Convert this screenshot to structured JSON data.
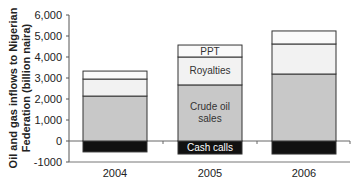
{
  "chart_data": {
    "type": "bar",
    "stacked": true,
    "title": "",
    "xlabel": "",
    "ylabel": "Oil and gas inflows to Nigerian Federation (billion naira)",
    "ylabel_lines": [
      "Oil and gas inflows to Nigerian",
      "Federation (billion naira)"
    ],
    "ylim": [
      -1000,
      6000
    ],
    "yticks": [
      -1000,
      0,
      1000,
      2000,
      3000,
      4000,
      5000,
      6000
    ],
    "ytick_labels": [
      "-1000",
      "0",
      "1,000",
      "2,000",
      "3,000",
      "4,000",
      "5,000",
      "6,000"
    ],
    "grid": false,
    "legend": "inline labels on 2005 bar",
    "categories": [
      "2004",
      "2005",
      "2006"
    ],
    "series": [
      {
        "name": "Cash calls",
        "color": "#111111",
        "text_color": "#ffffff",
        "values": [
          -520,
          -620,
          -620
        ]
      },
      {
        "name": "Crude oil sales",
        "color": "#c8c8c8",
        "text_color": "#333333",
        "values": [
          2140,
          2670,
          3190
        ]
      },
      {
        "name": "Royalties",
        "color": "#f2f2f2",
        "text_color": "#333333",
        "values": [
          810,
          1330,
          1430
        ]
      },
      {
        "name": "PPT",
        "color": "#fafafa",
        "text_color": "#333333",
        "values": [
          380,
          570,
          620
        ]
      }
    ],
    "inline_labels": {
      "category_index": 1,
      "labels": [
        "Cash calls",
        "Crude oil\nsales",
        "Royalties",
        "PPT"
      ]
    }
  }
}
